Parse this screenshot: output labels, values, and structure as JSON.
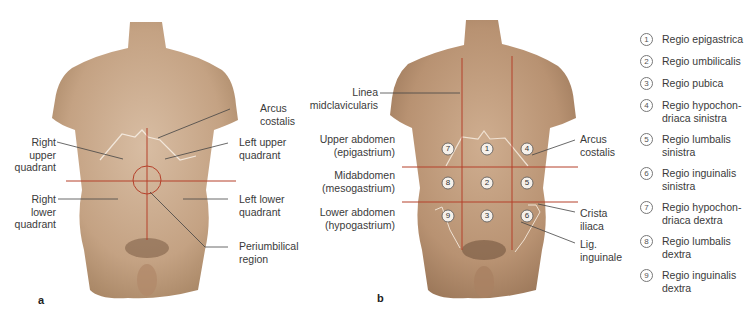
{
  "panel_a": {
    "letter": "a",
    "labels": {
      "arcus_costalis": [
        "Arcus",
        "costalis"
      ],
      "right_upper_quadrant": [
        "Right",
        "upper",
        "quadrant"
      ],
      "left_upper_quadrant": [
        "Left upper",
        "quadrant"
      ],
      "right_lower_quadrant": [
        "Right",
        "lower",
        "quadrant"
      ],
      "left_lower_quadrant": [
        "Left lower",
        "quadrant"
      ],
      "periumbilical_region": [
        "Periumbilical",
        "region"
      ]
    }
  },
  "panel_b": {
    "letter": "b",
    "labels": {
      "linea_midclavicularis": [
        "Linea",
        "midclavicularis"
      ],
      "upper_abdomen": [
        "Upper abdomen",
        "(epigastrium)"
      ],
      "midabdomen": [
        "Midabdomen",
        "(mesogastrium)"
      ],
      "lower_abdomen": [
        "Lower abdomen",
        "(hypogastrium)"
      ],
      "arcus_costalis": [
        "Arcus",
        "costalis"
      ],
      "crista_iliaca": [
        "Crista",
        "iliaca"
      ],
      "lig_inguinale": [
        "Lig.",
        "inguinale"
      ]
    },
    "region_numbers": [
      {
        "n": "7",
        "row": 0,
        "col": 0
      },
      {
        "n": "1",
        "row": 0,
        "col": 1
      },
      {
        "n": "4",
        "row": 0,
        "col": 2
      },
      {
        "n": "8",
        "row": 1,
        "col": 0
      },
      {
        "n": "2",
        "row": 1,
        "col": 1
      },
      {
        "n": "5",
        "row": 1,
        "col": 2
      },
      {
        "n": "9",
        "row": 2,
        "col": 0
      },
      {
        "n": "3",
        "row": 2,
        "col": 1
      },
      {
        "n": "6",
        "row": 2,
        "col": 2
      }
    ]
  },
  "legend": {
    "items": [
      {
        "num": "1",
        "text": "Regio epigastrica"
      },
      {
        "num": "2",
        "text": "Regio umbilicalis"
      },
      {
        "num": "3",
        "text": "Regio pubica"
      },
      {
        "num": "4",
        "text": "Regio hypochon-\ndriaca sinistra"
      },
      {
        "num": "5",
        "text": "Regio lumbalis\nsinistra"
      },
      {
        "num": "6",
        "text": "Regio inguinalis\nsinistra"
      },
      {
        "num": "7",
        "text": "Regio hypochon-\ndriaca dextra"
      },
      {
        "num": "8",
        "text": "Regio lumbalis\ndextra"
      },
      {
        "num": "9",
        "text": "Regio inguinalis\ndextra"
      }
    ]
  },
  "colors": {
    "skin": "#c9a78a",
    "skin_dark": "#9c7a5e",
    "region_line": "#b5402a",
    "leader_line": "#444444",
    "text": "#3a3a3a"
  }
}
